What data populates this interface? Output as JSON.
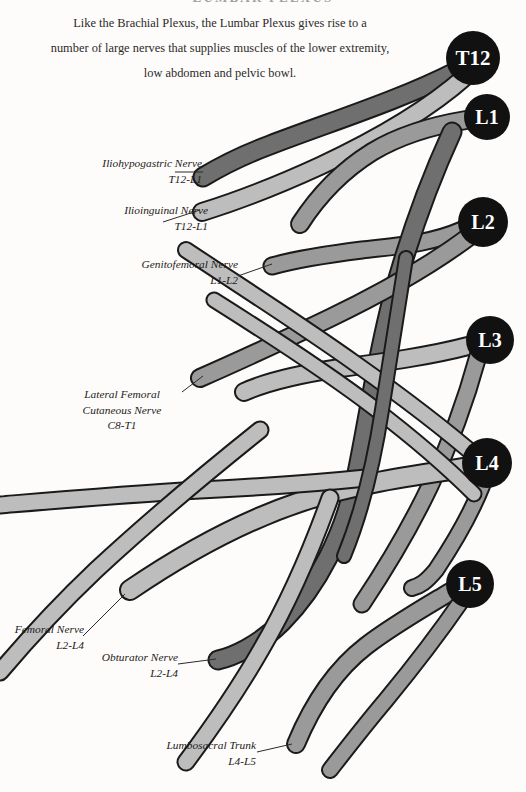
{
  "page": {
    "title": "LUMBAR PLEXUS",
    "background_color": "#fdfcfb",
    "text_color": "#231f20"
  },
  "intro": {
    "line1": "Like the Brachial Plexus, the Lumbar Plexus gives rise to a",
    "line2": "number of large nerves that supplies muscles of the lower extremity,",
    "line3": "low abdomen and pelvic bowl."
  },
  "colors": {
    "nerve_light": "#bdbdbd",
    "nerve_medium": "#9a9a9a",
    "nerve_dark": "#6f6f6f",
    "outline": "#1a1a1a",
    "vertebra_fill": "#111111",
    "vertebra_text": "#ffffff",
    "leader_line": "#2b2b2b"
  },
  "vertebrae": [
    {
      "label": "T12",
      "cx": 473,
      "cy": 58,
      "r": 27,
      "font_size": 21
    },
    {
      "label": "L1",
      "cx": 487,
      "cy": 117,
      "r": 23,
      "font_size": 20
    },
    {
      "label": "L2",
      "cx": 483,
      "cy": 222,
      "r": 25,
      "font_size": 20
    },
    {
      "label": "L3",
      "cx": 490,
      "cy": 340,
      "r": 24,
      "font_size": 20
    },
    {
      "label": "L4",
      "cx": 487,
      "cy": 463,
      "r": 25,
      "font_size": 20
    },
    {
      "label": "L5",
      "cx": 470,
      "cy": 584,
      "r": 24,
      "font_size": 20
    }
  ],
  "nerves": [
    {
      "id": "iliohypogastric",
      "name": "Iliohypogastric Nerve",
      "roots": "T12-L1",
      "shade": "dark",
      "label_x": 72,
      "label_y": 157,
      "label_align": "right",
      "label_width": 130
    },
    {
      "id": "ilioinguinal",
      "name": "Ilioinguinal Nerve",
      "roots": "T12-L1",
      "shade": "light",
      "label_x": 98,
      "label_y": 203,
      "label_align": "right",
      "label_width": 110
    },
    {
      "id": "genitofemoral",
      "name": "Genitofemoral Nerve",
      "roots": "L1-L2",
      "shade": "medium",
      "label_x": 136,
      "label_y": 257,
      "label_align": "right",
      "label_width": 124
    },
    {
      "id": "lateral-femoral-cutaneous",
      "name": "Lateral Femoral Cutaneous Nerve",
      "name_line1": "Lateral Femoral",
      "name_line2": "Cutaneous Nerve",
      "roots": "C8-T1",
      "shade": "medium",
      "label_x": 78,
      "label_y": 388,
      "label_align": "center",
      "label_width": 116
    },
    {
      "id": "femoral",
      "name": "Femoral Nerve",
      "roots": "L2-L4",
      "shade": "light",
      "label_x": 10,
      "label_y": 623,
      "label_align": "right",
      "label_width": 90
    },
    {
      "id": "obturator",
      "name": "Obturator Nerve",
      "roots": "L2-L4",
      "shade": "dark",
      "label_x": 100,
      "label_y": 648,
      "label_align": "right",
      "label_width": 105
    },
    {
      "id": "lumbosacral-trunk",
      "name": "Lumbosacral Trunk",
      "roots": "L4-L5",
      "shade": "medium",
      "label_x": 128,
      "label_y": 738,
      "label_align": "right",
      "label_width": 120
    }
  ]
}
